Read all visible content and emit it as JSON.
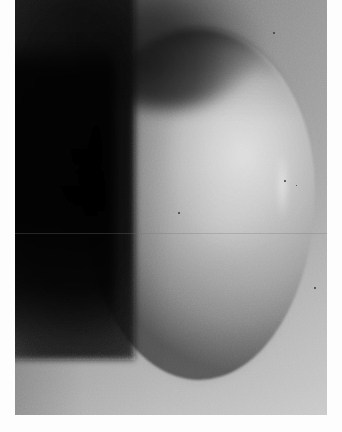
{
  "image": {
    "title": "Grayscale egg-shaped shadowgraph",
    "width": 342,
    "height": 432,
    "color_mode": "grayscale",
    "medium": "scanned photographic print"
  },
  "palette": {
    "paper_white": "#fdfdfd",
    "background_top_gray": "#7e7e7e",
    "background_bottom_gray": "#bdbdbd",
    "dark_slab_black": "#0a0a0a",
    "egg_highlight": "#d2d2d2",
    "egg_midtone": "#a2a2a2",
    "egg_shadow": "#555555",
    "speck_gray": "#3a3a3a",
    "scanline_gray": "#787878"
  },
  "regions": [
    {
      "name": "paper-margin-left",
      "description": "white paper border strip along the left edge",
      "x": 0,
      "y": 0,
      "width": 15,
      "height": 432,
      "value": "#fdfdfd"
    },
    {
      "name": "paper-margin-right",
      "description": "white paper border strip along the right edge",
      "x": 327,
      "y": 0,
      "width": 15,
      "height": 432,
      "value": "#fdfdfd"
    },
    {
      "name": "paper-margin-bottom",
      "description": "white paper border strip along the bottom edge",
      "x": 0,
      "y": 415,
      "width": 342,
      "height": 17,
      "value": "#fdfdfd"
    },
    {
      "name": "photographic-plate",
      "description": "exposed grayscale field, runs to the top edge of the frame",
      "x": 15,
      "y": 0,
      "width": 312,
      "height": 415,
      "value": "gray gradient, dark at top, light at bottom"
    },
    {
      "name": "dark-grainy-slab",
      "description": "very dark, heavily film-grained rectangular mass occupying the left side, fading out near the bottom",
      "x": 15,
      "y": 20,
      "width": 105,
      "height": 330,
      "value": "#0a0a0a"
    },
    {
      "name": "dark-hood",
      "description": "soft dark arc hooding the top of the bright ellipsoid",
      "x": 110,
      "y": 30,
      "width": 170,
      "height": 70,
      "value": "#141414"
    },
    {
      "name": "bright-ellipsoid",
      "description": "large luminous egg-shaped body filling the centre-right of the field",
      "x": 83,
      "y": 28,
      "width": 232,
      "height": 352,
      "value": "#b6b6b6"
    },
    {
      "name": "specular-sheen",
      "description": "broad diffuse bright lobe on the upper-right of the ellipsoid",
      "x": 165,
      "y": 60,
      "width": 150,
      "height": 190,
      "value": "#d2d2d2"
    },
    {
      "name": "limb-streak",
      "description": "narrow vertical bright streak near the right limb of the ellipsoid",
      "x": 277,
      "y": 150,
      "width": 11,
      "height": 72,
      "value": "#e4e4e4"
    },
    {
      "name": "terminator-shadow",
      "description": "soft dark shading along the left flank of the ellipsoid where it meets the dark slab",
      "x": 83,
      "y": 90,
      "width": 60,
      "height": 240,
      "value": "#3c3c3c"
    },
    {
      "name": "bottom-rim-shadow",
      "description": "curved darker shadow rim under the bottom-left of the ellipsoid",
      "x": 120,
      "y": 330,
      "width": 150,
      "height": 55,
      "value": "#6a6a6a"
    },
    {
      "name": "lower-background",
      "description": "light gray background visible below and around the ellipsoid",
      "x": 15,
      "y": 350,
      "width": 312,
      "height": 65,
      "value": "#b6b6b6"
    }
  ],
  "artifacts": {
    "scanline": {
      "description": "faint horizontal line crossing the full width of the plate",
      "y": 233,
      "value": "#787878"
    },
    "specks": [
      {
        "name": "speck-top-right",
        "x": 273,
        "y": 32,
        "size": 2
      },
      {
        "name": "speck-mid-right",
        "x": 284,
        "y": 180,
        "size": 2
      },
      {
        "name": "speck-center",
        "x": 178,
        "y": 212,
        "size": 2
      },
      {
        "name": "speck-right-edge",
        "x": 314,
        "y": 287,
        "size": 2
      },
      {
        "name": "speck-lower-right",
        "x": 296,
        "y": 185,
        "size": 1
      }
    ]
  }
}
